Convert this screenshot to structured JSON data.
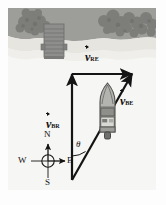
{
  "figure": {
    "scene": {
      "water_color": "#f6f6f4",
      "land_color": "#9a9a98",
      "beach_color": "#e3e2dd",
      "tree_color": "#7e7e7c",
      "dock_color": "#8f8f8d",
      "ink_color": "#1a1a1a"
    }
  },
  "vectors": [
    {
      "id": "v-br",
      "symbol": "v",
      "subscript": "BR",
      "label": "v⃗BR",
      "description": "velocity of boat relative to river, pointing north"
    },
    {
      "id": "v-re",
      "symbol": "v",
      "subscript": "RE",
      "label": "v⃗RE",
      "description": "velocity of river relative to earth, pointing east"
    },
    {
      "id": "v-be",
      "symbol": "v",
      "subscript": "BE",
      "label": "v⃗BE",
      "description": "velocity of boat relative to earth, resultant"
    }
  ],
  "angle": {
    "label": "θ",
    "name": "theta"
  },
  "compass": {
    "north": "N",
    "south": "S",
    "east": "E",
    "west": "W"
  }
}
